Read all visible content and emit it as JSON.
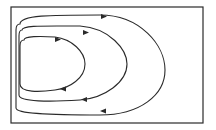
{
  "diagram": {
    "type": "phase-portrait",
    "frame": {
      "x": 11,
      "y": 7,
      "width": 192,
      "height": 116
    },
    "stroke_color": "#2a2a2a",
    "background_color": "#ffffff",
    "orbits": [
      {
        "id": "inner",
        "direction": "clockwise",
        "arrows": 2
      },
      {
        "id": "middle",
        "direction": "clockwise",
        "arrows": 2
      },
      {
        "id": "outer",
        "direction": "clockwise",
        "arrows": 2
      }
    ]
  }
}
